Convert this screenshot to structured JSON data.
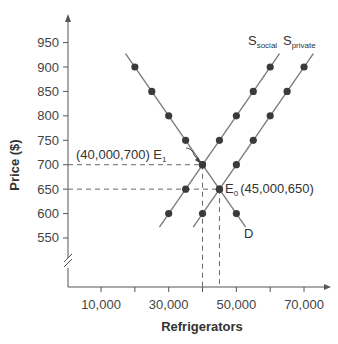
{
  "chart_data": {
    "type": "line",
    "title": "",
    "xlabel": "Refrigerators",
    "ylabel": "Price ($)",
    "xlim": [
      0,
      72000
    ],
    "ylim": [
      500,
      975
    ],
    "y_axis_break": true,
    "grid": false,
    "x_ticks": [
      10000,
      20000,
      30000,
      40000,
      50000,
      60000,
      70000
    ],
    "x_tick_labels": [
      "10,000",
      "",
      "30,000",
      "",
      "50,000",
      "",
      "70,000"
    ],
    "y_ticks": [
      550,
      600,
      650,
      700,
      750,
      800,
      850,
      900,
      950
    ],
    "y_tick_labels": [
      "550",
      "600",
      "650",
      "700",
      "750",
      "800",
      "850",
      "900",
      "950"
    ],
    "series": [
      {
        "name": "D",
        "label": "D",
        "points": [
          [
            20000,
            900
          ],
          [
            25000,
            850
          ],
          [
            30000,
            800
          ],
          [
            35000,
            750
          ],
          [
            40000,
            700
          ],
          [
            45000,
            650
          ],
          [
            50000,
            600
          ]
        ]
      },
      {
        "name": "S_social",
        "label": "S",
        "label_sub": "social",
        "points": [
          [
            30000,
            600
          ],
          [
            35000,
            650
          ],
          [
            40000,
            700
          ],
          [
            45000,
            750
          ],
          [
            50000,
            800
          ],
          [
            55000,
            850
          ],
          [
            60000,
            900
          ]
        ]
      },
      {
        "name": "S_private",
        "label": "S",
        "label_sub": "private",
        "points": [
          [
            40000,
            600
          ],
          [
            45000,
            650
          ],
          [
            50000,
            700
          ],
          [
            55000,
            750
          ],
          [
            60000,
            800
          ],
          [
            65000,
            850
          ],
          [
            70000,
            900
          ]
        ]
      }
    ],
    "annotations": [
      {
        "text": "(40,000,700) E",
        "sub": "1",
        "point": [
          40000,
          700
        ]
      },
      {
        "text": "E",
        "sub": "0",
        "suffix": "(45,000,650)",
        "point": [
          45000,
          650
        ]
      }
    ],
    "reference_lines": [
      {
        "type": "dashed",
        "from": [
          0,
          700
        ],
        "to": [
          40000,
          700
        ]
      },
      {
        "type": "dashed",
        "from": [
          40000,
          700
        ],
        "to": [
          40000,
          0
        ]
      },
      {
        "type": "dashed",
        "from": [
          0,
          650
        ],
        "to": [
          45000,
          650
        ]
      },
      {
        "type": "dashed",
        "from": [
          45000,
          650
        ],
        "to": [
          45000,
          0
        ]
      }
    ]
  },
  "labels": {
    "xlabel": "Refrigerators",
    "ylabel": "Price ($)",
    "demand": "D",
    "s_social_main": "S",
    "s_social_sub": "social",
    "s_private_main": "S",
    "s_private_sub": "private",
    "e1_text": "(40,000,700) E",
    "e1_sub": "1",
    "e0_main": "E",
    "e0_sub": "0",
    "e0_coords": "(45,000,650)"
  },
  "colors": {
    "line": "#777777",
    "point": "#3a3a3a",
    "axis": "#555555",
    "text": "#444444"
  }
}
